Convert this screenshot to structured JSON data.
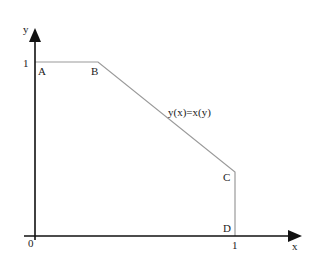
{
  "diagram": {
    "axes": {
      "x_label": "x",
      "y_label": "y",
      "origin_label": "0",
      "x_tick_label": "1",
      "y_tick_label": "1"
    },
    "points": {
      "A": "A",
      "B": "B",
      "C": "C",
      "D": "D"
    },
    "curve_label": "y(x)=x(y)",
    "colors": {
      "axis": "#111111",
      "curve": "#9a9a9a",
      "text": "#222222"
    }
  }
}
